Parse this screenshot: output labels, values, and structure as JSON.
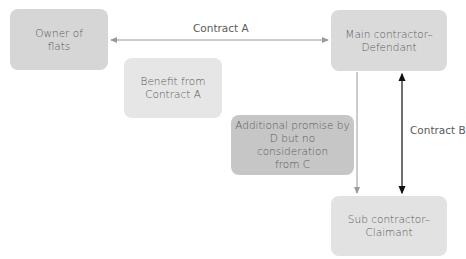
{
  "nodes": {
    "owner": {
      "label": "Owner of\nflats",
      "color": "#d6d6d6"
    },
    "benefit": {
      "label": "Benefit from\nContract A",
      "color": "#e6e6e6"
    },
    "main_contractor": {
      "label": "Main contractor–\nDefendant",
      "color": "#dadada"
    },
    "additional_promise": {
      "label": "Additional promise by\nD but no consideration\nfrom C",
      "color": "#c6c6c6"
    },
    "sub_contractor": {
      "label": "Sub contractor–\nClaimant",
      "color": "#e2e2e2"
    }
  },
  "edges": {
    "contract_a": {
      "label": "Contract A",
      "color": "#9a9a9a"
    },
    "promise_arrow": {
      "color": "#9a9a9a"
    },
    "contract_b": {
      "label": "Contract B",
      "color": "#111111"
    }
  }
}
